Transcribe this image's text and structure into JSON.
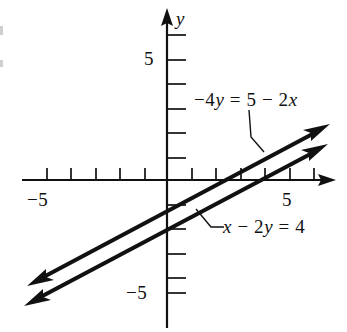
{
  "figure": {
    "background_color": "#ffffff",
    "ink_color": "#111111",
    "axis_labels": {
      "y_axis_name": "y"
    },
    "tick_labels": {
      "y_positive": "5",
      "y_negative": "−5",
      "x_negative": "−5",
      "x_positive": "5"
    },
    "annotations": [
      {
        "name": "equation-top",
        "text": "−4y = 5 − 2x",
        "parts": [
          {
            "text": "−4",
            "italic": false
          },
          {
            "text": "y",
            "italic": true
          },
          {
            "text": " = 5 − 2",
            "italic": false
          },
          {
            "text": "x",
            "italic": true
          }
        ]
      },
      {
        "name": "equation-bottom",
        "text": "x − 2y = 4",
        "parts": [
          {
            "text": "x",
            "italic": true
          },
          {
            "text": " − 2",
            "italic": false
          },
          {
            "text": "y",
            "italic": true
          },
          {
            "text": " = 4",
            "italic": false
          }
        ]
      }
    ]
  },
  "chart_data": {
    "type": "line",
    "title": "",
    "xlabel": "x",
    "ylabel": "y",
    "xlim": [
      -6.8,
      7.3
    ],
    "ylim": [
      -6.2,
      6.9
    ],
    "grid": false,
    "legend": "inline-annotations",
    "axes": {
      "origin_px": {
        "x": 167,
        "y": 180
      },
      "unit_px": 24.5,
      "x_ticks": [
        -5,
        -4,
        -3,
        -2,
        -1,
        1,
        2,
        3,
        4,
        5,
        6
      ],
      "y_ticks": [
        -5,
        -4,
        -3,
        -2,
        -1,
        1,
        2,
        3,
        4,
        5
      ],
      "labeled_x_ticks": [
        -5,
        5
      ],
      "labeled_y_ticks": [
        -5,
        5
      ],
      "arrowheads": [
        "x-positive",
        "y-positive"
      ]
    },
    "series": [
      {
        "name": "-4y = 5 - 2x",
        "equation": "−4y = 5 − 2x",
        "slope": 0.5,
        "y_intercept": -1.25,
        "x_intercept": 2.5,
        "label_text": "−4y = 5 − 2x",
        "points": [
          [
            -5.6,
            -4.05
          ],
          [
            6.5,
            2.0
          ]
        ],
        "arrow_both_ends": true
      },
      {
        "name": "x - 2y = 4",
        "equation": "x − 2y = 4",
        "slope": 0.5,
        "y_intercept": -2,
        "x_intercept": 4,
        "label_text": "x − 2y = 4",
        "points": [
          [
            -5.7,
            -4.85
          ],
          [
            6.4,
            1.2
          ]
        ],
        "arrow_both_ends": true
      }
    ],
    "note": "Two parallel lines of slope 1/2; no intersection (inconsistent system)."
  }
}
